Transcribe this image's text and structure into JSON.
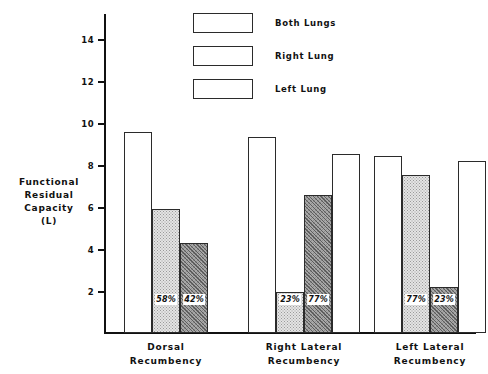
{
  "chart_data": {
    "type": "bar",
    "title": "",
    "subtitle": "",
    "xlabel": "",
    "ylabel": "Functional Residual Capacity (L)",
    "ylabel_lines": [
      "Functional",
      "Residual",
      "Capacity",
      "(L)"
    ],
    "ylim": [
      0,
      15.2
    ],
    "yticks": [
      2,
      4,
      6,
      8,
      10,
      12,
      14
    ],
    "ytick_labels": [
      "2",
      "4",
      "6",
      "8",
      "10",
      "12",
      "14"
    ],
    "grid": false,
    "legend_position": "top-center",
    "legend": [
      {
        "name": "Both Lungs",
        "fill": "none"
      },
      {
        "name": "Right Lung",
        "fill": "stipple"
      },
      {
        "name": "Left Lung",
        "fill": "hatch"
      }
    ],
    "categories": [
      "Dorsal Recumbency",
      "Right Lateral Recumbency",
      "Left Lateral Recumbency"
    ],
    "category_label_lines": [
      [
        "Dorsal",
        "Recumbency"
      ],
      [
        "Right Lateral",
        "Recumbency"
      ],
      [
        "Left Lateral",
        "Recumbency"
      ]
    ],
    "groups": [
      {
        "category": "Dorsal Recumbency",
        "bars": [
          {
            "series": "Both Lungs",
            "value": 9.6,
            "fill": "none",
            "pct": ""
          },
          {
            "series": "Right Lung",
            "value": 5.9,
            "fill": "stipple",
            "pct": "58%"
          },
          {
            "series": "Left Lung",
            "value": 4.3,
            "fill": "hatch",
            "pct": "42%"
          }
        ]
      },
      {
        "category": "Right Lateral Recumbency",
        "bars": [
          {
            "series": "Both Lungs",
            "value": 9.35,
            "fill": "none",
            "pct": ""
          },
          {
            "series": "Right Lung",
            "value": 1.95,
            "fill": "stipple",
            "pct": "23%"
          },
          {
            "series": "Left Lung",
            "value": 6.6,
            "fill": "hatch",
            "pct": "77%"
          },
          {
            "series": "Both Lungs",
            "value": 8.55,
            "fill": "none",
            "pct": ""
          }
        ]
      },
      {
        "category": "Left Lateral Recumbency",
        "bars": [
          {
            "series": "Both Lungs",
            "value": 8.45,
            "fill": "none",
            "pct": ""
          },
          {
            "series": "Right Lung",
            "value": 7.55,
            "fill": "stipple",
            "pct": "77%"
          },
          {
            "series": "Left Lung",
            "value": 2.2,
            "fill": "hatch",
            "pct": "23%"
          },
          {
            "series": "Both Lungs",
            "value": 8.2,
            "fill": "none",
            "pct": ""
          }
        ]
      }
    ],
    "annotations": [
      {
        "text": "58%",
        "group": 0,
        "bar": 1
      },
      {
        "text": "42%",
        "group": 0,
        "bar": 2
      },
      {
        "text": "23%",
        "group": 1,
        "bar": 1
      },
      {
        "text": "77%",
        "group": 1,
        "bar": 2
      },
      {
        "text": "77%",
        "group": 2,
        "bar": 1
      },
      {
        "text": "23%",
        "group": 2,
        "bar": 2
      }
    ],
    "colors": {
      "background": "#ffffff",
      "axis": "#111111",
      "bar_outline": "#2b2b2b",
      "fill_none": "#ffffff",
      "fill_stipple": "#e4e4e4",
      "fill_hatch": "#a8a8a8",
      "text": "#111111"
    }
  }
}
